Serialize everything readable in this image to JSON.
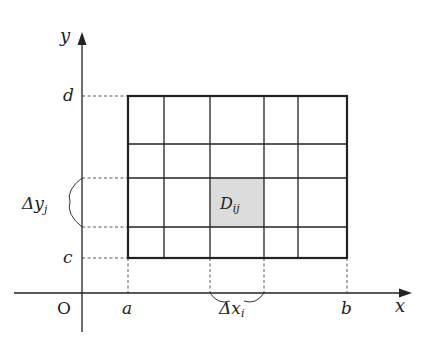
{
  "diagram": {
    "type": "double-integral-partition",
    "axes": {
      "x_label": "x",
      "y_label": "y",
      "origin_label": "O"
    },
    "x_ticks": [
      "a",
      "b"
    ],
    "y_ticks": [
      "c",
      "d"
    ],
    "cell_label": {
      "main": "D",
      "sub": "ij"
    },
    "delta_x": {
      "main": "Δx",
      "sub": "i"
    },
    "delta_y": {
      "main": "Δy",
      "sub": "j"
    },
    "colors": {
      "line": "#222222",
      "cell_fill": "#dcdcdc",
      "dashed": "#555555"
    },
    "grid": {
      "x_lines": [
        128,
        164,
        210,
        264,
        298,
        347
      ],
      "y_lines": [
        96,
        144,
        178,
        227,
        258
      ],
      "highlight": {
        "x0": 210,
        "x1": 264,
        "y0": 178,
        "y1": 227
      }
    }
  }
}
